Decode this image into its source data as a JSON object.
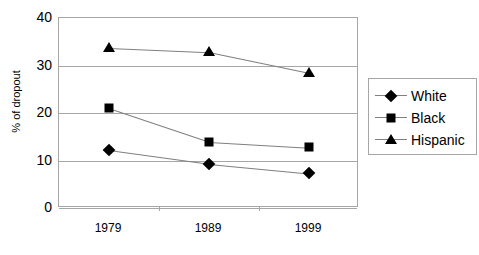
{
  "chart_data": {
    "type": "line",
    "title": "",
    "xlabel": "",
    "ylabel": "% of dropout",
    "categories": [
      "1979",
      "1989",
      "1999"
    ],
    "ylim": [
      0,
      40
    ],
    "yticks": [
      "0",
      "10",
      "20",
      "30",
      "40"
    ],
    "grid": "horizontal",
    "legend_position": "right",
    "series": [
      {
        "name": "White",
        "marker": "diamond",
        "color": "#000000",
        "values": [
          12.2,
          9.3,
          7.3
        ]
      },
      {
        "name": "Black",
        "marker": "square",
        "color": "#000000",
        "values": [
          21.1,
          14.0,
          12.8
        ]
      },
      {
        "name": "Hispanic",
        "marker": "triangle",
        "color": "#000000",
        "values": [
          33.7,
          32.8,
          28.4
        ]
      }
    ]
  },
  "axes": {
    "y_title": "% of dropout",
    "y_tick_labels": [
      "0",
      "10",
      "20",
      "30",
      "40"
    ],
    "x_tick_labels": [
      "1979",
      "1989",
      "1999"
    ]
  },
  "legend": {
    "entries": [
      {
        "label": "White"
      },
      {
        "label": "Black"
      },
      {
        "label": "Hispanic"
      }
    ]
  },
  "colors": {
    "marker": "#000000",
    "line": "#7f7f7f",
    "grid": "#a6a6a6",
    "frame": "#a6a6a6",
    "background": "#ffffff"
  }
}
